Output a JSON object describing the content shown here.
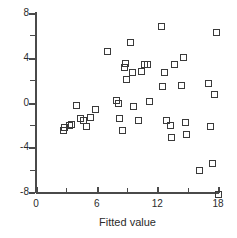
{
  "chart_data": {
    "type": "scatter",
    "title": "",
    "xlabel": "Fitted value",
    "ylabel": "Residual",
    "xlim": [
      0,
      18
    ],
    "ylim": [
      -8,
      8
    ],
    "grid": false,
    "legend": null,
    "marker": "open-square",
    "marker_color": "#3a3a3a",
    "xticks": [
      0,
      6,
      12,
      18
    ],
    "xticks_minor": [
      3,
      9,
      15
    ],
    "yticks": [
      8,
      4,
      0,
      -4,
      -8
    ],
    "yticks_minor": [
      6,
      2,
      -2,
      -6
    ],
    "points": [
      {
        "x": 2.7,
        "y": -2.5
      },
      {
        "x": 2.8,
        "y": -2.2
      },
      {
        "x": 3.3,
        "y": -2.0
      },
      {
        "x": 3.5,
        "y": -1.9
      },
      {
        "x": 4.0,
        "y": -0.2
      },
      {
        "x": 4.4,
        "y": -1.4
      },
      {
        "x": 4.6,
        "y": -1.6
      },
      {
        "x": 4.9,
        "y": -2.1
      },
      {
        "x": 5.3,
        "y": -1.3
      },
      {
        "x": 5.8,
        "y": -0.6
      },
      {
        "x": 7.0,
        "y": 4.6
      },
      {
        "x": 7.9,
        "y": 0.2
      },
      {
        "x": 8.1,
        "y": 0.0
      },
      {
        "x": 8.2,
        "y": -1.4
      },
      {
        "x": 8.5,
        "y": -2.5
      },
      {
        "x": 8.7,
        "y": 3.2
      },
      {
        "x": 8.8,
        "y": 3.5
      },
      {
        "x": 8.9,
        "y": 2.1
      },
      {
        "x": 9.3,
        "y": 5.4
      },
      {
        "x": 9.5,
        "y": 2.7
      },
      {
        "x": 9.6,
        "y": -0.3
      },
      {
        "x": 10.1,
        "y": -1.6
      },
      {
        "x": 10.4,
        "y": 2.8
      },
      {
        "x": 10.7,
        "y": 3.4
      },
      {
        "x": 11.0,
        "y": 3.4
      },
      {
        "x": 11.2,
        "y": 0.1
      },
      {
        "x": 12.4,
        "y": 6.8
      },
      {
        "x": 12.5,
        "y": 1.5
      },
      {
        "x": 12.7,
        "y": 2.7
      },
      {
        "x": 12.9,
        "y": -1.6
      },
      {
        "x": 13.3,
        "y": -2.0
      },
      {
        "x": 13.4,
        "y": -3.1
      },
      {
        "x": 13.6,
        "y": 3.4
      },
      {
        "x": 14.3,
        "y": 1.6
      },
      {
        "x": 14.5,
        "y": 4.1
      },
      {
        "x": 14.7,
        "y": -1.7
      },
      {
        "x": 14.8,
        "y": -2.8
      },
      {
        "x": 16.1,
        "y": -6.0
      },
      {
        "x": 17.0,
        "y": 1.7
      },
      {
        "x": 17.2,
        "y": -2.1
      },
      {
        "x": 17.4,
        "y": -5.4
      },
      {
        "x": 17.6,
        "y": 0.8
      },
      {
        "x": 17.8,
        "y": 6.3
      },
      {
        "x": 18.0,
        "y": -8.2
      }
    ]
  }
}
